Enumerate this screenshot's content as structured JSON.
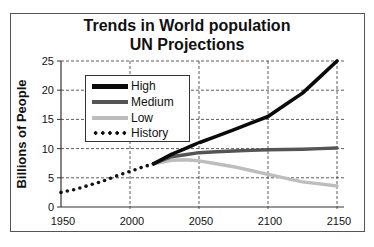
{
  "chart_data": {
    "type": "line",
    "title": "Trends in World population\nUN Projections",
    "title_lines": [
      "Trends in World population",
      "UN Projections"
    ],
    "xlabel": "",
    "ylabel": "Billions of People",
    "xlim": [
      1950,
      2150
    ],
    "ylim": [
      0,
      25
    ],
    "xticks": [
      "1950",
      "2000",
      "2050",
      "2100",
      "2150"
    ],
    "yticks": [
      "0",
      "5",
      "10",
      "15",
      "20",
      "25"
    ],
    "grid": true,
    "legend_position": "upper left",
    "series": [
      {
        "name": "High",
        "color": "#0a0a0a",
        "style": "solid",
        "x": [
          2017,
          2030,
          2050,
          2075,
          2100,
          2125,
          2150
        ],
        "values": [
          7.4,
          9.0,
          11.0,
          13.2,
          15.5,
          19.5,
          25.0
        ]
      },
      {
        "name": "Medium",
        "color": "#555555",
        "style": "solid",
        "x": [
          2017,
          2030,
          2050,
          2075,
          2100,
          2125,
          2150
        ],
        "values": [
          7.4,
          8.6,
          9.3,
          9.6,
          9.8,
          9.9,
          10.1
        ]
      },
      {
        "name": "Low",
        "color": "#bdbdbd",
        "style": "solid",
        "x": [
          2017,
          2030,
          2040,
          2050,
          2075,
          2100,
          2125,
          2150
        ],
        "values": [
          7.4,
          8.0,
          8.1,
          7.9,
          6.9,
          5.6,
          4.3,
          3.6
        ]
      },
      {
        "name": "History",
        "color": "#111111",
        "style": "dotted",
        "x": [
          1950,
          1960,
          1970,
          1980,
          1990,
          2000,
          2010,
          2017
        ],
        "values": [
          2.5,
          3.0,
          3.7,
          4.4,
          5.3,
          6.1,
          6.9,
          7.4
        ]
      }
    ]
  },
  "legend": {
    "items": [
      "High",
      "Medium",
      "Low",
      "History"
    ]
  }
}
